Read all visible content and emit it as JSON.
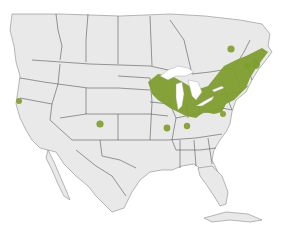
{
  "map": {
    "subject": "North America species range map",
    "colors": {
      "background": "#ffffff",
      "land": "#e9e9ea",
      "borders": "#4a4a4c",
      "lakes": "#ffffff",
      "range": "#7f9e2e"
    },
    "range_regions": [
      {
        "name": "main-northeast-range",
        "description": "Great Lakes region through New England and Maritimes"
      },
      {
        "name": "quebec-isolated-patch"
      },
      {
        "name": "nova-scotia-patch"
      },
      {
        "name": "california-coast-patch"
      },
      {
        "name": "colorado-patch"
      },
      {
        "name": "illinois-patch"
      },
      {
        "name": "indiana-patch"
      },
      {
        "name": "west-virginia-patch"
      }
    ]
  }
}
